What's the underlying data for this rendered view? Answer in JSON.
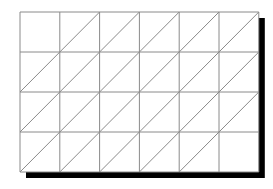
{
  "diagram": {
    "type": "triangulated-grid",
    "rows": 4,
    "cols": 6,
    "origin": {
      "x": 20,
      "y": 12
    },
    "cell_width": 39.8,
    "cell_height": 40,
    "line_color": "#8a8a8a",
    "shadow_color": "#000000",
    "shadow_offset": 6,
    "diagonal_direction": "bottom-left-to-top-right",
    "empty_cells": [
      [
        0,
        0
      ],
      [
        3,
        5
      ]
    ]
  }
}
